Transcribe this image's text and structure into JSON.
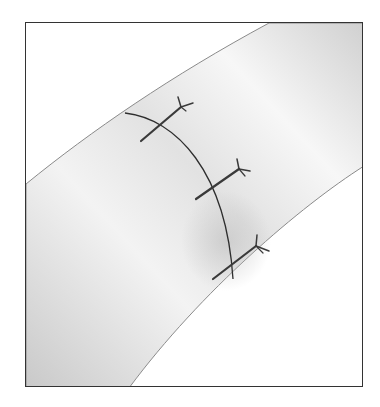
{
  "illustration": {
    "subject": "tubular vessel with circumferential anastomosis and three interrupted sutures",
    "sutures": 3,
    "colors": {
      "frame": "#333333",
      "vessel_light": "#f4f4f4",
      "vessel_shade": "#c8c8c8",
      "suture": "#3a3a3a",
      "background": "#ffffff"
    }
  }
}
